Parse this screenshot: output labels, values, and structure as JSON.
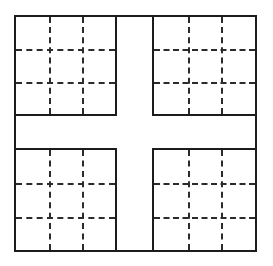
{
  "figure": {
    "background_color": "#ffffff",
    "solid_line_color": "#1c1c1c",
    "dashed_line_color": "#2b2b2b",
    "solid_line_width_px": 2,
    "dashed_line_width_px": 2,
    "dash_length_px": 8,
    "dash_gap_px": 5,
    "canvas": {
      "width": 273,
      "height": 266
    }
  },
  "diagram_data": {
    "type": "grid-partition",
    "outer_frame": {
      "x": 14,
      "y": 15,
      "width": 243,
      "height": 237
    },
    "center_cross": {
      "vertical_band": {
        "x_start": 117,
        "x_end": 152,
        "width": 35
      },
      "horizontal_band": {
        "y_start": 116,
        "y_end": 148,
        "height": 32
      },
      "fill": "#ffffff",
      "description": "Empty white cross-shaped band separating the four quadrants"
    },
    "quadrant_count": 4,
    "subgrid_rows": 3,
    "subgrid_cols": 3,
    "dashed_lines_per_axis": 2,
    "quadrants": [
      {
        "name": "top-left",
        "x": 14,
        "y": 15,
        "width": 103,
        "height": 101,
        "dash_v_fractions": [
          0.3333,
          0.6667
        ],
        "dash_h_fractions": [
          0.3333,
          0.6667
        ]
      },
      {
        "name": "top-right",
        "x": 152,
        "y": 15,
        "width": 105,
        "height": 101,
        "dash_v_fractions": [
          0.3333,
          0.6667
        ],
        "dash_h_fractions": [
          0.3333,
          0.6667
        ]
      },
      {
        "name": "bottom-left",
        "x": 14,
        "y": 148,
        "width": 103,
        "height": 104,
        "dash_v_fractions": [
          0.3333,
          0.6667
        ],
        "dash_h_fractions": [
          0.3333,
          0.6667
        ]
      },
      {
        "name": "bottom-right",
        "x": 152,
        "y": 148,
        "width": 105,
        "height": 104,
        "dash_v_fractions": [
          0.3333,
          0.6667
        ],
        "dash_h_fractions": [
          0.3333,
          0.6667
        ]
      }
    ]
  }
}
